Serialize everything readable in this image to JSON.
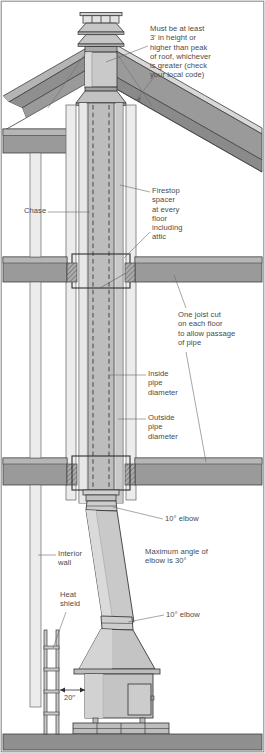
{
  "diagram": {
    "frame_color": "#8c8c8c",
    "colors": {
      "outline": "#3a3a3a",
      "pipe_fill": "#c9c9c9",
      "pipe_light": "#e2e2e2",
      "chase_fill": "#ececec",
      "framing_dark": "#8f8f8f",
      "framing_mid": "#a8a8a8",
      "floor_slab": "#8f8f8f",
      "stove_fill": "#c4c4c4",
      "brick_fill": "#bdbdbd",
      "text": "#4a4a4a",
      "leader": "#6b6b6b"
    },
    "labels": [
      {
        "name": "chimney-height-note",
        "text": "Must be at least\n3' in height or\nhigher than peak\nof roof, whichever\nis greater (check\nyour local code)",
        "x": 150,
        "y": 24
      },
      {
        "name": "chase-label",
        "text": "Chase",
        "x": 24,
        "y": 208
      },
      {
        "name": "firestop-spacer-note",
        "text": "Firestop\nspacer\nat every\nfloor\nincluding\nattic",
        "x": 152,
        "y": 188
      },
      {
        "name": "joist-cut-note",
        "text": "One joist cut\non each floor\nto allow passage\nof pipe",
        "x": 178,
        "y": 312
      },
      {
        "name": "inside-pipe-diameter-label",
        "text": "Inside\npipe\ndiameter",
        "x": 148,
        "y": 371
      },
      {
        "name": "outside-pipe-diameter-label",
        "text": "Outside\npipe\ndiameter",
        "x": 148,
        "y": 415
      },
      {
        "name": "upper-elbow-label",
        "text": "10° elbow",
        "x": 165,
        "y": 516
      },
      {
        "name": "max-angle-note",
        "text": "Maximum angle of\nelbow is 30°",
        "x": 145,
        "y": 549
      },
      {
        "name": "interior-wall-label",
        "text": "Interior\nwall",
        "x": 58,
        "y": 551
      },
      {
        "name": "heat-shield-label",
        "text": "Heat\nshield",
        "x": 60,
        "y": 592
      },
      {
        "name": "lower-elbow-label",
        "text": "10° elbow",
        "x": 166,
        "y": 612
      },
      {
        "name": "clearance-dimension-label",
        "text": "20′′",
        "x": 64,
        "y": 692
      }
    ],
    "parts": [
      "chimney-cap",
      "chimney-stack",
      "roof-gable",
      "roof-slope",
      "chase",
      "insulated-pipe",
      "firestop-spacer",
      "attic-floor",
      "second-floor",
      "first-floor",
      "ten-degree-elbow-upper",
      "slanted-stovepipe",
      "ten-degree-elbow-lower",
      "stove-hood",
      "stove-body",
      "stove-door",
      "heat-shield",
      "interior-wall",
      "brick-hearth",
      "floor-slab"
    ]
  }
}
